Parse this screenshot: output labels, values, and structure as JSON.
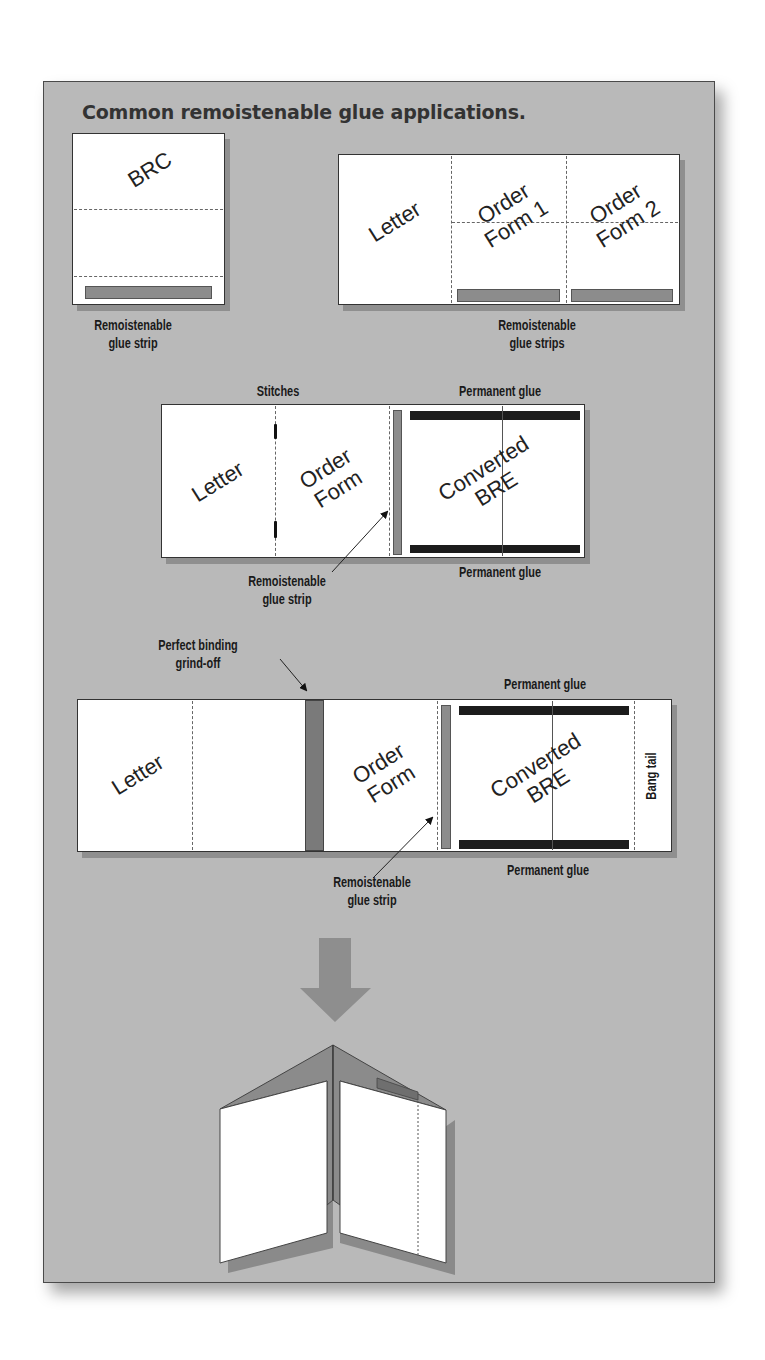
{
  "figure": {
    "title": "Common remoistenable glue applications.",
    "colors": {
      "panel_bg": "#b9b9b9",
      "sheet": "#ffffff",
      "remoistenable_strip": "#8c8c8c",
      "permanent_glue": "#1c1c1c",
      "grind_off": "#7a7a7a",
      "arrow": "#8e8e8e"
    }
  },
  "diagram_brc": {
    "panel_label": "BRC",
    "caption_line1": "Remoistenable",
    "caption_line2": "glue strip"
  },
  "diagram_order_forms": {
    "panels": [
      "Letter",
      "Order\nForm 1",
      "Order\nForm 2"
    ],
    "panel_letter": "Letter",
    "panel_order1_line1": "Order",
    "panel_order1_line2": "Form 1",
    "panel_order2_line1": "Order",
    "panel_order2_line2": "Form 2",
    "caption_line1": "Remoistenable",
    "caption_line2": "glue strips"
  },
  "diagram_stitched": {
    "label_stitches": "Stitches",
    "label_permanent_top": "Permanent glue",
    "label_permanent_bottom": "Permanent glue",
    "panel_letter": "Letter",
    "panel_order_line1": "Order",
    "panel_order_line2": "Form",
    "panel_bre_line1": "Converted",
    "panel_bre_line2": "BRE",
    "caption_line1": "Remoistenable",
    "caption_line2": "glue strip"
  },
  "diagram_perfect_bound": {
    "label_grind_line1": "Perfect binding",
    "label_grind_line2": "grind-off",
    "label_permanent_top": "Permanent glue",
    "label_permanent_bottom": "Permanent glue",
    "panel_letter": "Letter",
    "panel_order_line1": "Order",
    "panel_order_line2": "Form",
    "panel_bre_line1": "Converted",
    "panel_bre_line2": "BRE",
    "panel_bang_tail": "Bang tail",
    "caption_line1": "Remoistenable",
    "caption_line2": "glue strip"
  },
  "result": {
    "arrow": "down-arrow",
    "illustration": "folded-booklet"
  }
}
